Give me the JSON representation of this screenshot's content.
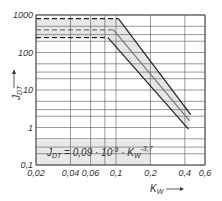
{
  "chart_data": {
    "type": "line",
    "title": "",
    "xlabel": "K_W",
    "ylabel": "J_DT",
    "x_scale": "log",
    "y_scale": "log",
    "xlim": [
      0.02,
      0.6
    ],
    "ylim": [
      0.1,
      1000
    ],
    "grid": true,
    "x_ticks": [
      "0,02",
      "0,04",
      "0,06",
      "0,1",
      "0,2",
      "0,4",
      "0,6"
    ],
    "x_tick_values": [
      0.02,
      0.04,
      0.06,
      0.1,
      0.2,
      0.4,
      0.6
    ],
    "y_ticks": [
      "0,1",
      "1",
      "10",
      "100",
      "1000"
    ],
    "y_tick_values": [
      0.1,
      1,
      10,
      100,
      1000
    ],
    "annotation": "J_DT = 0,09 · 10^-9 · K_W^-3,7",
    "series": [
      {
        "name": "upper bound",
        "style": "solid",
        "x": [
          0.02,
          0.105,
          0.45
        ],
        "y": [
          800,
          800,
          2.2
        ]
      },
      {
        "name": "mean",
        "style": "solid-gray",
        "x": [
          0.02,
          0.095,
          0.44
        ],
        "y": [
          400,
          400,
          1.5
        ]
      },
      {
        "name": "lower bound",
        "style": "solid",
        "x": [
          0.02,
          0.085,
          0.43
        ],
        "y": [
          250,
          250,
          0.9
        ]
      }
    ],
    "band_fill": "#e6e6e6"
  },
  "labels": {
    "y_axis": "J",
    "y_axis_sub": "DT",
    "x_axis": "K",
    "x_axis_sub": "W",
    "formula_lhs": "J",
    "formula_lhs_sub": "DT",
    "formula_mid": " = 0,09 · 10",
    "formula_exp1": "-9",
    "formula_k": " · K",
    "formula_k_sub": "W",
    "formula_exp2": "-3,7"
  }
}
